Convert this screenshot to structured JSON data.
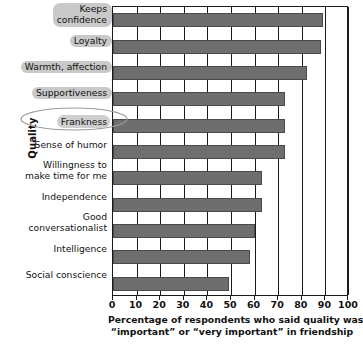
{
  "chart_data": {
    "type": "bar",
    "orientation": "horizontal",
    "title": "",
    "xlabel": "Percentage of respondents who said quality was “important” or “very important” in friendship",
    "xlabel_line1": "Percentage of respondents who said quality was",
    "xlabel_line2": "“important” or “very important” in friendship",
    "ylabel": "Quality",
    "xlim": [
      0,
      100
    ],
    "xticks": [
      "0",
      "10",
      "20",
      "30",
      "40",
      "50",
      "60",
      "70",
      "80",
      "90",
      "100"
    ],
    "grid": true,
    "legend": "none",
    "bar_color": "#6e6e6e",
    "categories": [
      "Keeps\nconfidence",
      "Loyalty",
      "Warmth, affection",
      "Supportiveness",
      "Frankness",
      "Sense of humor",
      "Willingness to\nmake time for me",
      "Independence",
      "Good\nconversationalist",
      "Intelligence",
      "Social conscience"
    ],
    "values": [
      89,
      88,
      82,
      73,
      73,
      73,
      63,
      63,
      60,
      58,
      49
    ],
    "highlighted_categories": [
      "Keeps confidence",
      "Loyalty",
      "Warmth, affection",
      "Supportiveness",
      "Frankness"
    ]
  }
}
